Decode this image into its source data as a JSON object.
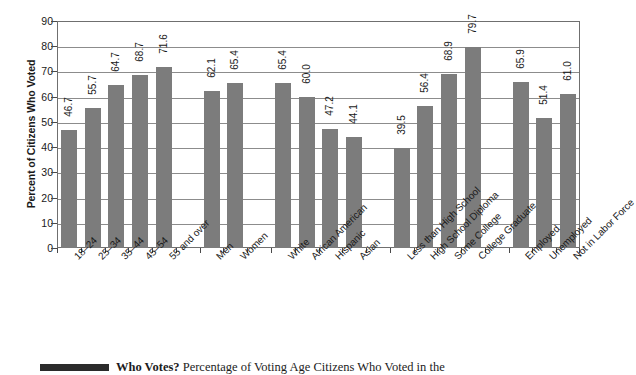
{
  "chart_data": {
    "type": "bar",
    "title": "",
    "xlabel": "",
    "ylabel": "Percent of Citizens Who Voted",
    "ylim": [
      0,
      90
    ],
    "yticks": [
      0,
      10,
      20,
      30,
      40,
      50,
      60,
      70,
      80,
      90
    ],
    "grid": true,
    "legend": "none",
    "bar_color": "#7c7c7c",
    "categories": [
      "18–24",
      "25–34",
      "35–44",
      "45–54",
      "55 and over",
      "",
      "Men",
      "Women",
      "",
      "White",
      "African American",
      "Hispanic",
      "Asian",
      "",
      "Less than High School",
      "High School Diploma",
      "Some College",
      "College Graduate",
      "",
      "Employed",
      "Unemployed",
      "Not in Labor Force"
    ],
    "values": [
      46.7,
      55.7,
      64.7,
      68.7,
      71.6,
      null,
      62.1,
      65.4,
      null,
      65.4,
      60.0,
      47.2,
      44.1,
      null,
      39.5,
      56.4,
      68.9,
      79.7,
      null,
      65.9,
      51.4,
      61.0
    ],
    "value_labels": [
      "46.7",
      "55.7",
      "64.7",
      "68.7",
      "71.6",
      "",
      "62.1",
      "65.4",
      "",
      "65.4",
      "60.0",
      "47.2",
      "44.1",
      "",
      "39.5",
      "56.4",
      "68.9",
      "79.7",
      "",
      "65.9",
      "51.4",
      "61.0"
    ],
    "groups": [
      {
        "name": "Age",
        "categories": [
          "18–24",
          "25–34",
          "35–44",
          "45–54",
          "55 and over"
        ]
      },
      {
        "name": "Gender",
        "categories": [
          "Men",
          "Women"
        ]
      },
      {
        "name": "Race/Ethnicity",
        "categories": [
          "White",
          "African American",
          "Hispanic",
          "Asian"
        ]
      },
      {
        "name": "Education",
        "categories": [
          "Less than High School",
          "High School Diploma",
          "Some College",
          "College Graduate"
        ]
      },
      {
        "name": "Employment Status",
        "categories": [
          "Employed",
          "Unemployed",
          "Not in Labor Force"
        ]
      }
    ]
  },
  "caption": {
    "bold_part": "Who Votes? ",
    "rest": "Percentage of Voting Age Citizens Who Voted in the"
  }
}
